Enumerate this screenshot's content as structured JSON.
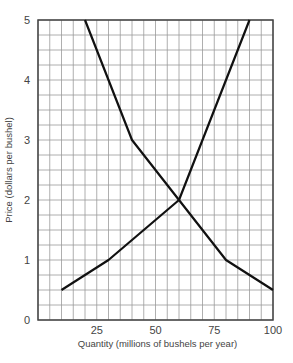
{
  "chart_data": {
    "type": "line",
    "title": "",
    "xlabel": "Quantity (millions of bushels per year)",
    "ylabel": "Price (dollars per bushel)",
    "xlim": [
      0,
      100
    ],
    "ylim": [
      0,
      5
    ],
    "x_ticks": [
      25,
      50,
      75,
      100
    ],
    "x_tick_labels": [
      "25",
      "50",
      "75",
      "100"
    ],
    "y_ticks": [
      0,
      1,
      2,
      3,
      4,
      5
    ],
    "y_tick_labels": [
      "0",
      "1",
      "2",
      "3",
      "4",
      "5"
    ],
    "grid": true,
    "grid_x_step": 5,
    "grid_y_step": 0.25,
    "legend": null,
    "series": [
      {
        "name": "Demand",
        "points": [
          [
            20,
            5
          ],
          [
            40,
            3
          ],
          [
            60,
            2
          ],
          [
            80,
            1
          ],
          [
            100,
            0.5
          ]
        ]
      },
      {
        "name": "Supply",
        "points": [
          [
            10,
            0.5
          ],
          [
            30,
            1
          ],
          [
            60,
            2
          ],
          [
            90,
            5
          ]
        ]
      }
    ],
    "annotations": [
      {
        "type": "intersection",
        "x": 60,
        "y": 2
      }
    ]
  },
  "colors": {
    "line": "#111111",
    "grid": "#9a9a9a",
    "frame": "#444444",
    "text": "#444444"
  }
}
